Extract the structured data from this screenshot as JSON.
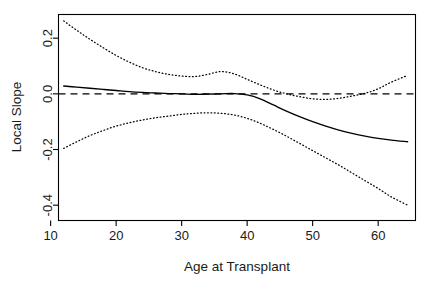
{
  "chart_data": {
    "type": "line",
    "title": "",
    "xlabel": "Age at Transplant",
    "ylabel": "Local Slope",
    "xlim": [
      11.2,
      65.7
    ],
    "ylim": [
      -0.455,
      0.285
    ],
    "xticks": [
      10,
      20,
      30,
      40,
      50,
      60
    ],
    "xticklabels": [
      "10",
      "20",
      "30",
      "40",
      "50",
      "60"
    ],
    "yticks": [
      0.2,
      0.0,
      -0.2,
      -0.4
    ],
    "yticklabels": [
      "0.2",
      "0.0",
      "-0.2",
      "-0.4"
    ],
    "grid": false,
    "legend": false,
    "box": "full-rect",
    "reference_line": {
      "name": "zero-reference",
      "y": 0.0,
      "style": "dashed",
      "color": "#000000"
    },
    "series": [
      {
        "name": "local slope estimate",
        "style": "solid",
        "color": "#000000",
        "x": [
          12.0,
          14.0,
          16.0,
          18.0,
          20.0,
          22.0,
          24.0,
          26.0,
          28.0,
          30.0,
          32.0,
          34.0,
          36.0,
          38.0,
          40.0,
          42.0,
          44.0,
          46.0,
          48.0,
          50.0,
          52.0,
          54.0,
          56.0,
          58.0,
          60.0,
          62.0,
          64.5
        ],
        "y": [
          0.028,
          0.024,
          0.02,
          0.016,
          0.012,
          0.008,
          0.005,
          0.003,
          0.001,
          0.0,
          -0.002,
          -0.001,
          0.0,
          0.001,
          -0.004,
          -0.018,
          -0.04,
          -0.062,
          -0.082,
          -0.1,
          -0.116,
          -0.13,
          -0.142,
          -0.152,
          -0.16,
          -0.166,
          -0.172
        ]
      },
      {
        "name": "upper confidence band",
        "style": "dotted",
        "color": "#000000",
        "x": [
          12.0,
          14.0,
          16.0,
          18.0,
          20.0,
          22.0,
          24.0,
          26.0,
          28.0,
          30.0,
          32.0,
          34.0,
          36.0,
          38.0,
          40.0,
          42.0,
          44.0,
          46.0,
          48.0,
          50.0,
          52.0,
          54.0,
          56.0,
          58.0,
          60.0,
          62.0,
          64.5
        ],
        "y": [
          0.262,
          0.228,
          0.196,
          0.166,
          0.138,
          0.114,
          0.094,
          0.08,
          0.07,
          0.064,
          0.062,
          0.07,
          0.08,
          0.072,
          0.052,
          0.032,
          0.014,
          0.0,
          -0.01,
          -0.018,
          -0.02,
          -0.016,
          -0.008,
          0.002,
          0.018,
          0.042,
          0.066
        ]
      },
      {
        "name": "lower confidence band",
        "style": "dotted",
        "color": "#000000",
        "x": [
          12.0,
          14.0,
          16.0,
          18.0,
          20.0,
          22.0,
          24.0,
          26.0,
          28.0,
          30.0,
          32.0,
          34.0,
          36.0,
          38.0,
          40.0,
          42.0,
          44.0,
          46.0,
          48.0,
          50.0,
          52.0,
          54.0,
          56.0,
          58.0,
          60.0,
          62.0,
          64.5
        ],
        "y": [
          -0.196,
          -0.172,
          -0.15,
          -0.132,
          -0.116,
          -0.104,
          -0.094,
          -0.086,
          -0.08,
          -0.074,
          -0.07,
          -0.068,
          -0.07,
          -0.076,
          -0.088,
          -0.106,
          -0.128,
          -0.152,
          -0.178,
          -0.204,
          -0.23,
          -0.256,
          -0.284,
          -0.312,
          -0.34,
          -0.37,
          -0.4
        ]
      }
    ]
  }
}
